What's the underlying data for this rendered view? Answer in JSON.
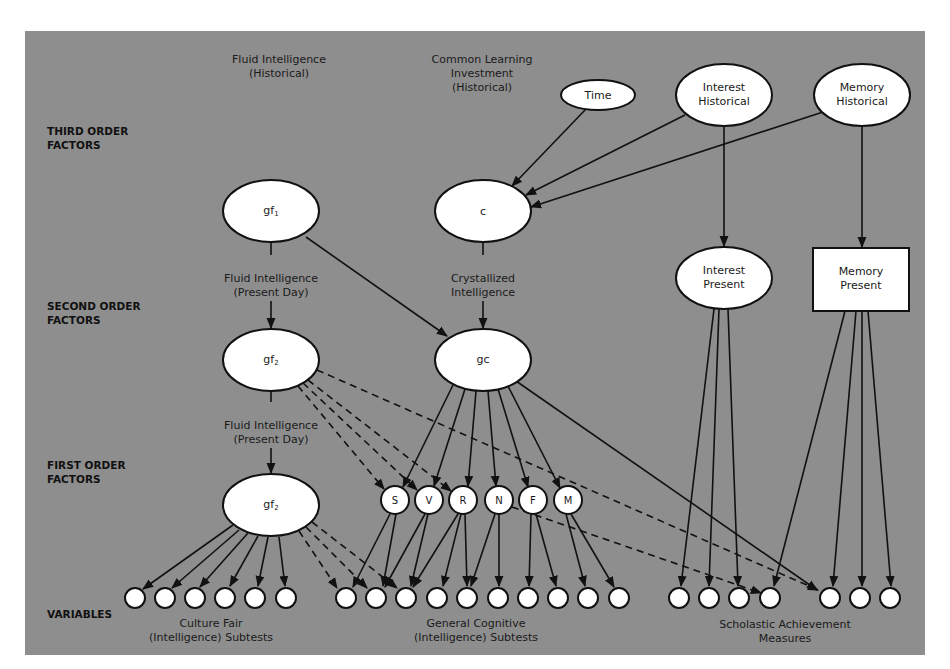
{
  "diagram": {
    "colors": {
      "background": "#8e8e8e",
      "node_fill": "#ffffff",
      "stroke": "#111111"
    },
    "levels": [
      {
        "id": "third",
        "line1": "THIRD ORDER",
        "line2": "FACTORS"
      },
      {
        "id": "second",
        "line1": "SECOND ORDER",
        "line2": "FACTORS"
      },
      {
        "id": "first",
        "line1": "FIRST ORDER",
        "line2": "FACTORS"
      },
      {
        "id": "vars",
        "line1": "VARIABLES"
      }
    ],
    "headings": {
      "fluid_hist": {
        "line1": "Fluid Intelligence",
        "line2": "(Historical)"
      },
      "common_learning": {
        "line1": "Common Learning",
        "line2": "Investment",
        "line3": "(Historical)"
      }
    },
    "edge_labels": {
      "fluid_present_1": {
        "line1": "Fluid Intelligence",
        "line2": "(Present Day)"
      },
      "crystallized": {
        "line1": "Crystallized",
        "line2": "Intelligence"
      },
      "fluid_present_2": {
        "line1": "Fluid Intelligence",
        "line2": "(Present Day)"
      }
    },
    "nodes": {
      "gf1": {
        "label": "gf",
        "sub": "1"
      },
      "c": {
        "label": "c"
      },
      "time": {
        "label": "Time"
      },
      "interest_hist": {
        "line1": "Interest",
        "line2": "Historical"
      },
      "memory_hist": {
        "line1": "Memory",
        "line2": "Historical"
      },
      "interest_present": {
        "line1": "Interest",
        "line2": "Present"
      },
      "memory_present": {
        "line1": "Memory",
        "line2": "Present"
      },
      "gf2_second": {
        "label": "gf",
        "sub": "2"
      },
      "gc": {
        "label": "gc"
      },
      "gf2_first": {
        "label": "gf",
        "sub": "2"
      },
      "primaries": [
        "S",
        "V",
        "R",
        "N",
        "F",
        "M"
      ]
    },
    "variable_groups": [
      {
        "id": "culture_fair",
        "line1": "Culture Fair",
        "line2": "(Intelligence) Subtests",
        "count": 6
      },
      {
        "id": "general_cognitive",
        "line1": "General Cognitive",
        "line2": "(Intelligence) Subtests",
        "count": 10
      },
      {
        "id": "scholastic",
        "line1": "Scholastic Achievement",
        "line2": "Measures",
        "count": 7
      }
    ]
  }
}
